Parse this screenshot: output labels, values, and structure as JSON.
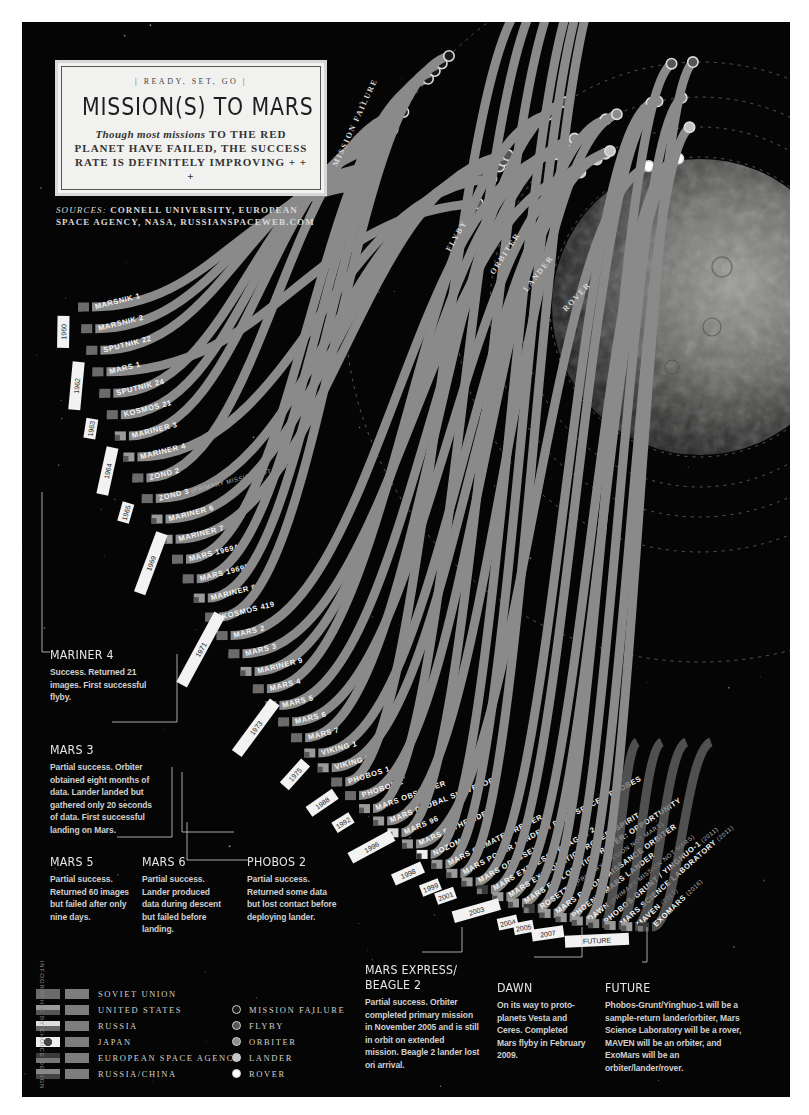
{
  "header": {
    "kicker": "| READY, SET, GO |",
    "title": "MISSION(S) TO MARS",
    "dek_italic": "Though most missions",
    "dek_rest": " TO THE RED PLANET HAVE FAILED, THE SUCCESS RATE IS DEFINITELY IMPROVING + + +"
  },
  "sources": {
    "label": "SOURCES:",
    "text": " CORNELL UNIVERSITY, EUROPEAN SPACE AGENCY, NASA, RUSSIANSPACEWEB.COM"
  },
  "orbits": [
    {
      "label": "MISSION FAILURE"
    },
    {
      "label": "FLYBY"
    },
    {
      "label": "ORBITER"
    },
    {
      "label": "LANDER"
    },
    {
      "label": "ROVER"
    }
  ],
  "years": [
    "1960",
    "1962",
    "1963",
    "1964",
    "1965",
    "1969",
    "1971",
    "1973",
    "1975",
    "1988",
    "1992",
    "1996",
    "1998",
    "1999",
    "2001",
    "2003",
    "2004",
    "2005",
    "2007",
    "FUTURE"
  ],
  "missions": [
    {
      "name": "MARSNIK 1",
      "year": "1960",
      "agency": "soviet",
      "outcome": "failure"
    },
    {
      "name": "MARSNIK 2",
      "year": "1960",
      "agency": "soviet",
      "outcome": "failure"
    },
    {
      "name": "SPUTNIK 22",
      "year": "1962",
      "agency": "soviet",
      "outcome": "failure"
    },
    {
      "name": "MARS 1",
      "year": "1962",
      "agency": "soviet",
      "outcome": "flyby"
    },
    {
      "name": "SPUTNIK 24",
      "year": "1962",
      "agency": "soviet",
      "outcome": "failure"
    },
    {
      "name": "KOSMOS 21",
      "year": "1963",
      "agency": "soviet",
      "outcome": "failure"
    },
    {
      "name": "MARINER 3",
      "year": "1964",
      "agency": "us",
      "outcome": "failure"
    },
    {
      "name": "MARINER 4",
      "year": "1964",
      "agency": "us",
      "outcome": "flyby"
    },
    {
      "name": "ZOND 2",
      "year": "1964",
      "agency": "soviet",
      "outcome": "failure"
    },
    {
      "name": "ZOND 3",
      "sub": " (PRIMARY MISSION NOT MARS)",
      "year": "1965",
      "agency": "soviet",
      "outcome": "flyby"
    },
    {
      "name": "MARINER 6",
      "year": "1969",
      "agency": "us",
      "outcome": "flyby"
    },
    {
      "name": "MARINER 7",
      "year": "1969",
      "agency": "us",
      "outcome": "flyby"
    },
    {
      "name": "MARS 1969A",
      "year": "1969",
      "agency": "soviet",
      "outcome": "failure"
    },
    {
      "name": "MARS 1969B",
      "year": "1969",
      "agency": "soviet",
      "outcome": "failure"
    },
    {
      "name": "MARINER 8",
      "year": "1971",
      "agency": "us",
      "outcome": "failure"
    },
    {
      "name": "KOSMOS 419",
      "year": "1971",
      "agency": "soviet",
      "outcome": "failure"
    },
    {
      "name": "MARS 2",
      "year": "1971",
      "agency": "soviet",
      "outcome": "orbiter"
    },
    {
      "name": "MARS 3",
      "year": "1971",
      "agency": "soviet",
      "outcome": "lander"
    },
    {
      "name": "MARINER 9",
      "year": "1971",
      "agency": "us",
      "outcome": "orbiter"
    },
    {
      "name": "MARS 4",
      "year": "1973",
      "agency": "soviet",
      "outcome": "flyby"
    },
    {
      "name": "MARS 5",
      "year": "1973",
      "agency": "soviet",
      "outcome": "orbiter"
    },
    {
      "name": "MARS 6",
      "year": "1973",
      "agency": "soviet",
      "outcome": "lander"
    },
    {
      "name": "MARS 7",
      "year": "1973",
      "agency": "soviet",
      "outcome": "flyby"
    },
    {
      "name": "VIKING 1",
      "year": "1975",
      "agency": "us",
      "outcome": "lander"
    },
    {
      "name": "VIKING 2",
      "year": "1975",
      "agency": "us",
      "outcome": "lander"
    },
    {
      "name": "PHOBOS 1",
      "year": "1988",
      "agency": "soviet",
      "outcome": "failure"
    },
    {
      "name": "PHOBOS 2",
      "year": "1988",
      "agency": "soviet",
      "outcome": "orbiter"
    },
    {
      "name": "MARS OBSERVER",
      "year": "1992",
      "agency": "us",
      "outcome": "failure"
    },
    {
      "name": "MARS GLOBAL SURVEYOR",
      "year": "1996",
      "agency": "us",
      "outcome": "orbiter"
    },
    {
      "name": "MARS 96",
      "year": "1996",
      "agency": "russia",
      "outcome": "failure"
    },
    {
      "name": "MARS PATHFINDER",
      "year": "1996",
      "agency": "us",
      "outcome": "rover"
    },
    {
      "name": "NOZOMI",
      "year": "1998",
      "agency": "japan",
      "outcome": "failure"
    },
    {
      "name": "MARS CLIMATE ORBITER",
      "year": "1998",
      "agency": "us",
      "outcome": "failure"
    },
    {
      "name": "MARS POLAR LANDER / DEEP SPACE 2 PROBES",
      "year": "1999",
      "agency": "us",
      "outcome": "failure"
    },
    {
      "name": "MARS ODYSSEY",
      "year": "2001",
      "agency": "us",
      "outcome": "orbiter"
    },
    {
      "name": "MARS EXPRESS / BEAGLE 2",
      "year": "2003",
      "agency": "esa",
      "outcome": "orbiter"
    },
    {
      "name": "MARS EXPLORATION ROVER: SPIRIT",
      "year": "2003",
      "agency": "us",
      "outcome": "rover"
    },
    {
      "name": "MARS EXPLORATION ROVER: OPPORTUNITY",
      "year": "2003",
      "agency": "us",
      "outcome": "rover"
    },
    {
      "name": "ROSETTA",
      "sub": " (PRIMARY MISSION NOT MARS)",
      "year": "2004",
      "agency": "esa",
      "outcome": "flyby"
    },
    {
      "name": "MARS RECONNAISSANCE ORBITER",
      "year": "2005",
      "agency": "us",
      "outcome": "orbiter"
    },
    {
      "name": "PHOENIX MARS LANDER",
      "year": "2007",
      "agency": "us",
      "outcome": "lander"
    },
    {
      "name": "DAWN",
      "sub": " (PRIMARY MISSION NOT MARS)",
      "year": "2007",
      "agency": "us",
      "outcome": "flyby"
    },
    {
      "name": "PHOBOS-GRUNT / YINGHUO-1",
      "sub": " (2011)",
      "year": "FUTURE",
      "agency": "russiachina",
      "outcome": "future"
    },
    {
      "name": "MARS SCIENCE LABORATORY",
      "sub": " (2011)",
      "year": "FUTURE",
      "agency": "us",
      "outcome": "future"
    },
    {
      "name": "MAVEN",
      "sub": " (2013)",
      "year": "FUTURE",
      "agency": "us",
      "outcome": "future"
    },
    {
      "name": "EXOMARS",
      "sub": " (2016)",
      "year": "FUTURE",
      "agency": "esa",
      "outcome": "future"
    }
  ],
  "notes": [
    {
      "id": "mariner4",
      "title": "MARINER 4",
      "body": "Success. Returned 21 images. First successful flyby."
    },
    {
      "id": "mars3",
      "title": "MARS 3",
      "body": "Partial success. Orbiter obtained eight months of data. Lander landed but gathered only 20 seconds of data. First successful landing on Mars."
    },
    {
      "id": "mars5",
      "title": "MARS 5",
      "body": "Partial success. Returned 60 images but failed after only nine days."
    },
    {
      "id": "mars6",
      "title": "MARS 6",
      "body": "Partial success. Lander produced data during descent but failed before landing."
    },
    {
      "id": "phobos2",
      "title": "PHOBOS 2",
      "body": "Partial success. Returned some data but lost contact before deploying lander."
    },
    {
      "id": "marsexpress",
      "title": "MARS EXPRESS/ BEAGLE 2",
      "body": "Partial success. Orbiter completed primary mission in November 2005 and is still in orbit on extended mission. Beagle 2 lander lost on arrival."
    },
    {
      "id": "dawn",
      "title": "DAWN",
      "body": "On its way to proto-planets Vesta and Ceres. Completed Mars flyby in February 2009."
    },
    {
      "id": "future",
      "title": "FUTURE",
      "body": "Phobos-Grunt/Yinghuo-1 will be a sample-return lander/orbiter, Mars Science Laboratory will be a rover, MAVEN will be an orbiter, and ExoMars will be an orbiter/lander/rover."
    }
  ],
  "legend": {
    "agencies": [
      {
        "key": "soviet",
        "label": "SOVIET UNION"
      },
      {
        "key": "us",
        "label": "UNITED STATES"
      },
      {
        "key": "russia",
        "label": "RUSSIA"
      },
      {
        "key": "japan",
        "label": "JAPAN"
      },
      {
        "key": "esa",
        "label": "EUROPEAN SPACE AGENCY"
      },
      {
        "key": "russiachina",
        "label": "RUSSIA/CHINA"
      }
    ],
    "outcomes": [
      {
        "key": "failure",
        "label": "MISSION FAILURE"
      },
      {
        "key": "flyby",
        "label": "FLYBY"
      },
      {
        "key": "orbiter",
        "label": "ORBITER"
      },
      {
        "key": "lander",
        "label": "LANDER"
      },
      {
        "key": "rover",
        "label": "ROVER"
      }
    ]
  },
  "credit": "INFOGRAPHIC BY CHOICE DESIGN",
  "colors": {
    "background": "#050505",
    "band": "#8a8a8a",
    "band_dark": "#6e6e6e",
    "dot_failure": "#1a1a1a",
    "dot_flyby": "#555555",
    "dot_orbiter": "#8c8c8c",
    "dot_lander": "#c4c4c4",
    "dot_rover": "#ffffff"
  }
}
